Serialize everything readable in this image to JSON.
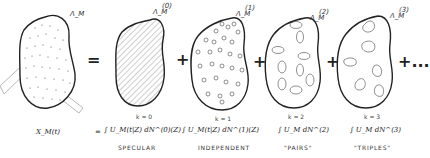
{
  "diagram": {
    "main_region_label": "Λ_M",
    "equals_symbol": "=",
    "terms": [
      {
        "k_label": "k = 0",
        "region_label": "Λ_M",
        "order": "(0)",
        "caption": "SPECULAR",
        "formula": "∫ U_M(t|Z) dN^(0)(Z)",
        "fill": "hatched"
      },
      {
        "k_label": "k = 1",
        "region_label": "Λ_M",
        "order": "(1)",
        "caption": "INDEPENDENT",
        "formula": "∫ U_M(t|Z) dN^(1)(Z)",
        "fill": "single circles"
      },
      {
        "k_label": "k = 2",
        "region_label": "Λ_M",
        "order": "(2)",
        "caption": "\"PAIRS\"",
        "formula": "∫ U_M dN^(2)",
        "fill": "pairs"
      },
      {
        "k_label": "k = 3",
        "region_label": "Λ_M",
        "order": "(3)",
        "caption": "\"TRIPLES\"",
        "formula": "∫ U_M dN^(3)",
        "fill": "triples"
      }
    ],
    "plus_symbol": "+",
    "continuation": "+...",
    "lhs_formula": "X_M(t)",
    "formula_equals": "=",
    "formula_plus": "+"
  }
}
